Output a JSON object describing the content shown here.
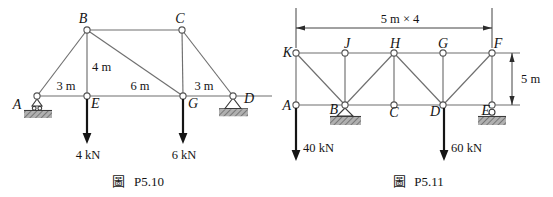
{
  "colors": {
    "member_gray": "#6f6f6f",
    "ink_black": "#151515",
    "ground_gray": "#b0b0b0",
    "hatch_dark": "#5f5f5f"
  },
  "fig_p510": {
    "caption_char": "圖",
    "caption_text": "P5.10",
    "labels": {
      "A": "A",
      "B": "B",
      "C": "C",
      "D": "D",
      "E": "E",
      "G": "G"
    },
    "dims": {
      "span_ae": "3 m",
      "span_eg": "6 m",
      "span_gd": "3 m",
      "height_be": "4 m"
    },
    "loads": {
      "at_e": "4 kN",
      "at_g": "6 kN"
    },
    "supports": {
      "at_a": "roller-support-icon",
      "at_d": "pin-support-icon"
    }
  },
  "fig_p511": {
    "caption_char": "圖",
    "caption_text": "P5.11",
    "labels": {
      "K": "K",
      "J": "J",
      "H": "H",
      "G": "G",
      "F": "F",
      "A": "A",
      "B": "B",
      "C": "C",
      "D": "D",
      "E": "E"
    },
    "dims": {
      "top": "5 m × 4",
      "right": "5 m"
    },
    "loads": {
      "at_a": "40 kN",
      "at_d": "60 kN"
    },
    "supports": {
      "at_b": "pin-support-icon",
      "at_e": "roller-support-icon"
    }
  }
}
